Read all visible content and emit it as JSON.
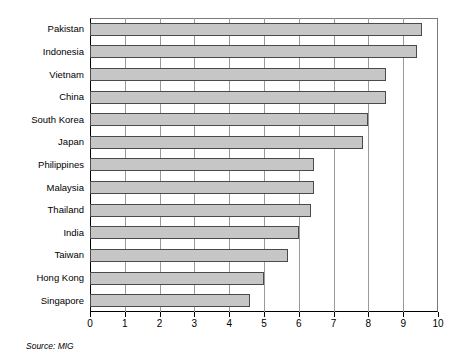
{
  "chart_data": {
    "type": "bar",
    "orientation": "horizontal",
    "title": "",
    "subtitle": "",
    "xlabel": "",
    "ylabel": "",
    "xlim": [
      0,
      10
    ],
    "xticks": [
      "0",
      "1",
      "2",
      "3",
      "4",
      "5",
      "6",
      "7",
      "8",
      "9",
      "10"
    ],
    "grid": true,
    "legend": false,
    "categories": [
      "Pakistan",
      "Indonesia",
      "Vietnam",
      "China",
      "South Korea",
      "Japan",
      "Philippines",
      "Malaysia",
      "Thailand",
      "India",
      "Taiwan",
      "Hong Kong",
      "Singapore"
    ],
    "values": [
      9.55,
      9.4,
      8.5,
      8.5,
      8.0,
      7.85,
      6.45,
      6.45,
      6.35,
      6.0,
      5.7,
      5.0,
      4.6
    ],
    "annotations": [
      "Source: MIG"
    ],
    "colors": {
      "bar_fill": "#c6c6c6",
      "bar_border": "#4a4a4a",
      "axis": "#000000",
      "gridline": "#9a9a9a",
      "background": "#ffffff"
    }
  },
  "source_note": "Source: MIG"
}
